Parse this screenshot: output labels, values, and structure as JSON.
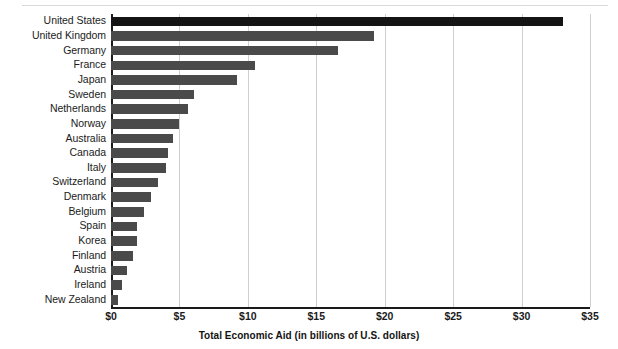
{
  "chart": {
    "type": "bar",
    "orientation": "horizontal",
    "xlabel": "Total Economic Aid (in billions of U.S. dollars)",
    "ylabel": "",
    "title": "",
    "grid": true,
    "legend": false,
    "xlim": [
      0,
      35
    ],
    "xticks": [
      0,
      5,
      10,
      15,
      20,
      25,
      30,
      35
    ],
    "xticklabels": [
      "$0",
      "$5",
      "$10",
      "$15",
      "$20",
      "$25",
      "$30",
      "$35"
    ],
    "bar_color": "#4a4a4a",
    "highlight_color": "#141414",
    "gridline_color": "#cfcfcf",
    "axis_color": "#1a1a1a"
  },
  "chart_data": {
    "type": "bar",
    "title": "",
    "xlabel": "Total Economic Aid (in billions of U.S. dollars)",
    "ylabel": "",
    "xlim": [
      0,
      35
    ],
    "grid": true,
    "legend": false,
    "orientation": "horizontal",
    "categories": [
      "United States",
      "United Kingdom",
      "Germany",
      "France",
      "Japan",
      "Sweden",
      "Netherlands",
      "Norway",
      "Australia",
      "Canada",
      "Italy",
      "Switzerland",
      "Denmark",
      "Belgium",
      "Spain",
      "Korea",
      "Finland",
      "Austria",
      "Ireland",
      "New Zealand"
    ],
    "values": [
      33.0,
      19.2,
      16.6,
      10.5,
      9.2,
      6.1,
      5.6,
      5.0,
      4.5,
      4.2,
      4.0,
      3.4,
      2.9,
      2.4,
      1.9,
      1.9,
      1.6,
      1.2,
      0.8,
      0.5
    ],
    "xticks": [
      0,
      5,
      10,
      15,
      20,
      25,
      30,
      35
    ],
    "xticklabels": [
      "$0",
      "$5",
      "$10",
      "$15",
      "$20",
      "$25",
      "$30",
      "$35"
    ]
  }
}
